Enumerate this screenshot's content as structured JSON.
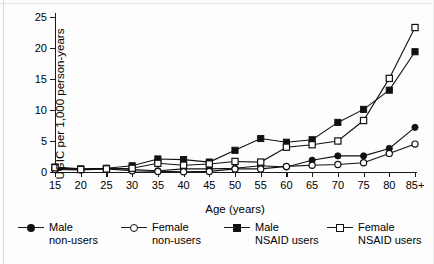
{
  "chart_data": {
    "type": "line",
    "title": "",
    "xlabel": "Age (years)",
    "ylabel": "UGIC per 1,000 person-years",
    "categories": [
      "15",
      "20",
      "25",
      "30",
      "35",
      "40",
      "45",
      "50",
      "55",
      "60",
      "65",
      "70",
      "75",
      "80",
      "85+"
    ],
    "ylim": [
      0,
      25
    ],
    "yticks": [
      0,
      5,
      10,
      15,
      20,
      25
    ],
    "grid": false,
    "legend_position": "bottom",
    "series": [
      {
        "name": "Male non-users",
        "label_line1": "Male",
        "label_line2": "non-users",
        "marker": "filled-circle",
        "values": [
          0.6,
          0.4,
          0.6,
          0.4,
          0.2,
          0.5,
          0.5,
          0.6,
          1.0,
          0.8,
          1.9,
          2.6,
          2.6,
          3.8,
          7.2
        ]
      },
      {
        "name": "Female non-users",
        "label_line1": "Female",
        "label_line2": "non-users",
        "marker": "open-circle",
        "values": [
          0.4,
          0.35,
          0.5,
          0.2,
          0.1,
          0.05,
          0.1,
          0.5,
          0.5,
          0.9,
          1.1,
          1.2,
          1.5,
          3.0,
          4.5
        ]
      },
      {
        "name": "Male NSAID users",
        "label_line1": "Male",
        "label_line2": "NSAID users",
        "marker": "filled-square",
        "values": [
          0.8,
          0.5,
          0.6,
          1.0,
          2.1,
          2.0,
          1.6,
          3.5,
          5.4,
          4.8,
          5.2,
          8.0,
          10.1,
          13.2,
          19.4
        ]
      },
      {
        "name": "Female NSAID users",
        "label_line1": "Female",
        "label_line2": "NSAID users",
        "marker": "open-square",
        "values": [
          0.7,
          0.4,
          0.5,
          0.6,
          1.4,
          1.1,
          1.3,
          1.7,
          1.6,
          4.0,
          4.4,
          5.0,
          8.3,
          15.1,
          23.3
        ]
      }
    ]
  },
  "axes": {
    "y_label": "UGIC per 1,000 person-years",
    "x_label": "Age (years)"
  },
  "colors": {
    "ink": "#111111",
    "background": "#ffffff"
  }
}
